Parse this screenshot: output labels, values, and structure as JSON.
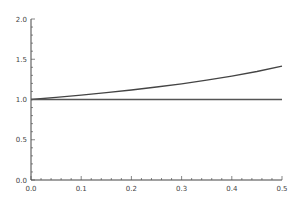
{
  "chart_data": {
    "type": "line",
    "title": "",
    "xlabel": "",
    "ylabel": "",
    "xlim": [
      0.0,
      0.5
    ],
    "ylim": [
      0.0,
      2.0
    ],
    "grid": false,
    "legend": null,
    "x_ticks": [
      "0.0",
      "0.1",
      "0.2",
      "0.3",
      "0.4",
      "0.5"
    ],
    "y_ticks": [
      "0.0",
      "0.5",
      "1.0",
      "1.5",
      "2.0"
    ],
    "x": [
      0.0,
      0.05,
      0.1,
      0.15,
      0.2,
      0.25,
      0.3,
      0.35,
      0.4,
      0.45,
      0.5
    ],
    "series": [
      {
        "name": "curve",
        "color": "#444444",
        "values": [
          1.0,
          1.026,
          1.054,
          1.085,
          1.118,
          1.155,
          1.195,
          1.24,
          1.291,
          1.348,
          1.414
        ]
      },
      {
        "name": "baseline",
        "color": "#555555",
        "values": [
          1.0,
          1.0,
          1.0,
          1.0,
          1.0,
          1.0,
          1.0,
          1.0,
          1.0,
          1.0,
          1.0
        ]
      }
    ]
  }
}
